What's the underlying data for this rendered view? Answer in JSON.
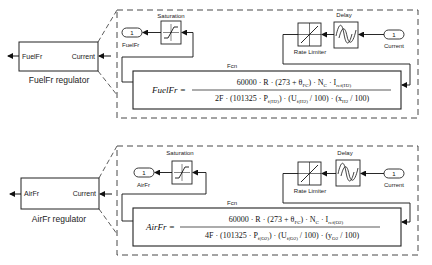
{
  "regulators": [
    {
      "id": "fuel",
      "block_label": "FuelFr regulator",
      "out_port_label": "FuelFr",
      "in_port_label": "Current",
      "subsystem": {
        "saturation_label": "Saturation",
        "delay_label": "Delay",
        "rate_limiter_label": "Rate Limiter",
        "fcn_label": "Fcn",
        "outport": {
          "number": "1",
          "name": "FuelFr"
        },
        "inport": {
          "number": "1",
          "name": "Current"
        },
        "equation": {
          "lhs": "FuelFr =",
          "numerator": "60000 · R · (273 + θ_FC) · N_C · I_ref(H2)",
          "numerator_parts": [
            "60000 · R · (273 + θ",
            "FC",
            ") · N",
            "C",
            " · I",
            "ref(H2)"
          ],
          "denominator": "2F · (101325 · P_f(H2)) · (U_f(H2) / 100) · (x_H2 / 100)",
          "denominator_parts": [
            "2F · (101325 · P",
            "f(H2)",
            ") · (U",
            "f(H2)",
            " / 100) · (x",
            "H2",
            " / 100)"
          ]
        }
      }
    },
    {
      "id": "air",
      "block_label": "AirFr regulator",
      "out_port_label": "AirFr",
      "in_port_label": "Current",
      "subsystem": {
        "saturation_label": "Saturation",
        "delay_label": "Delay",
        "rate_limiter_label": "Rate Limiter",
        "fcn_label": "Fcn",
        "outport": {
          "number": "1",
          "name": "AirFr"
        },
        "inport": {
          "number": "1",
          "name": "Current"
        },
        "equation": {
          "lhs": "AirFr =",
          "numerator": "60000 · R · (273 + θ_FC) · N_C · I_ref(O2)",
          "numerator_parts": [
            "60000 · R · (273 + θ",
            "FC",
            ") · N",
            "C",
            " · I",
            "ref(O2)"
          ],
          "denominator": "4F · (101325 · P_f(O2)) · (U_f(O2) / 100) · (y_O2 / 100)",
          "denominator_parts": [
            "4F · (101325 · P",
            "f(O2)",
            ") · (U",
            "f(O2)",
            " / 100) · (y",
            "O2",
            " / 100)"
          ]
        }
      }
    }
  ]
}
